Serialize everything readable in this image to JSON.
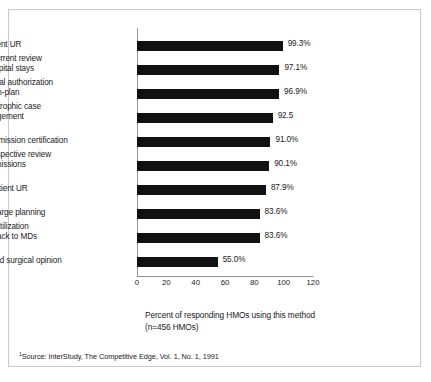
{
  "chart_data": {
    "type": "bar",
    "orientation": "horizontal",
    "title": "",
    "subtitle": "",
    "xlabel": "Percent of responding HMOs using this method\n(n=456 HMOs)",
    "ylabel": "",
    "xlim": [
      0,
      120
    ],
    "xticks": [
      0,
      20,
      40,
      60,
      80,
      100,
      120
    ],
    "xticklabels": [
      "0",
      "20",
      "40",
      "60",
      "80",
      "100",
      "120"
    ],
    "grid": false,
    "legend": null,
    "bar_color": "#111111",
    "categories": [
      "Inpatient UR",
      "Concurrent review\nof hospital stays",
      "Referral authorization\nfor non-plan",
      "Catastrophic case\nmanagement",
      "Preadmission certification",
      "Retrospective review\nof admissions",
      "Outpatient UR",
      "Discharge planning",
      "Cost/utilization\nfeedback to MDs",
      "Second surgical opinion"
    ],
    "values": [
      99.3,
      97.1,
      96.9,
      92.5,
      91.0,
      90.1,
      87.9,
      83.6,
      83.6,
      55.0
    ],
    "value_labels": [
      "99.3%",
      "97.1%",
      "96.9%",
      "92.5",
      "91.0%",
      "90.1%",
      "87.9%",
      "83.6%",
      "83.6%",
      "55.0%"
    ],
    "annotations": [
      "Source: InterStudy, The Competitive Edge, Vol. 1, No. 1, 1991"
    ]
  },
  "axis_caption": "Percent of responding HMOs using this method\n(n=456 HMOs)",
  "source": {
    "marker": "1",
    "text": "Source: InterStudy, The Competitive Edge, Vol. 1, No. 1, 1991"
  }
}
